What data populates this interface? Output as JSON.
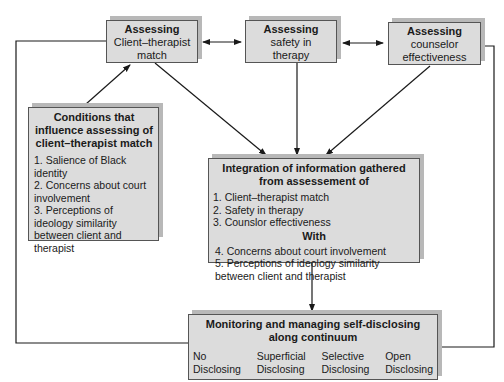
{
  "diagram": {
    "assess_boxes": [
      {
        "title": "Assessing",
        "line1": "Client–therapist",
        "line2": "match"
      },
      {
        "title": "Assessing",
        "line1": "safety in",
        "line2": "therapy"
      },
      {
        "title": "Assessing",
        "line1": "counselor",
        "line2": "effectiveness"
      }
    ],
    "conditions": {
      "title": "Conditions that influence assessing of client–therapist match",
      "items": [
        "1. Salience of Black identity",
        "2. Concerns about court involvement",
        "3. Perceptions of ideology similarity between client and therapist"
      ]
    },
    "integration": {
      "title": "Integration of information gathered from assessement of",
      "items": [
        "1. Client–therapist match",
        "2. Safety in therapy",
        "3. Counslor effectiveness"
      ],
      "with_label": "With",
      "with_items": [
        "4. Concerns about court involvement",
        "5. Perceptions of ideology similarity between client and therapist"
      ]
    },
    "monitoring": {
      "title": "Monitoring and managing self-disclosing along continuum",
      "continuum": [
        {
          "line1": "No",
          "line2": "Disclosing"
        },
        {
          "line1": "Superficial",
          "line2": "Disclosing"
        },
        {
          "line1": "Selective",
          "line2": "Disclosing"
        },
        {
          "line1": "Open",
          "line2": "Disclosing"
        }
      ]
    },
    "colors": {
      "box_fill": "#dcdcdc",
      "box_shadow": "#b8b8b8",
      "line": "#1a1a1a"
    }
  }
}
